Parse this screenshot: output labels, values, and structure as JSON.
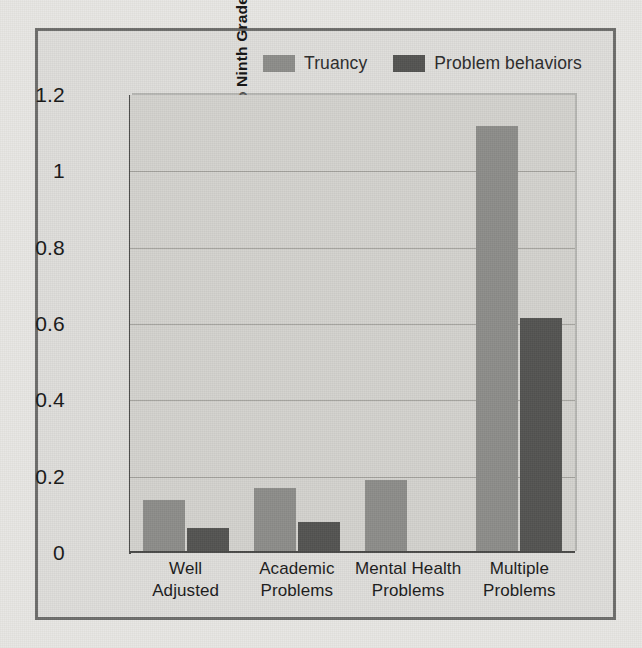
{
  "chart_data": {
    "type": "bar",
    "title": "",
    "xlabel": "",
    "ylabel": "Mean Increase from Eighth to Ninth Grade",
    "ylim": [
      0,
      1.2
    ],
    "yticks": [
      "0",
      "0.2",
      "0.4",
      "0.6",
      "0.8",
      "1",
      "1.2"
    ],
    "ytick_values": [
      0,
      0.2,
      0.4,
      0.6,
      0.8,
      1,
      1.2
    ],
    "grid": true,
    "legend_position": "top",
    "categories": [
      "Well\nAdjusted",
      "Academic\nProblems",
      "Mental Health\nProblems",
      "Multiple\nProblems"
    ],
    "category_lines": [
      [
        "Well",
        "Adjusted"
      ],
      [
        "Academic",
        "Problems"
      ],
      [
        "Mental Health",
        "Problems"
      ],
      [
        "Multiple",
        "Problems"
      ]
    ],
    "series": [
      {
        "name": "Truancy",
        "color": "#8d8d8a",
        "values": [
          0.14,
          0.17,
          0.19,
          1.12
        ]
      },
      {
        "name": "Problem behaviors",
        "color": "#545452",
        "values": [
          0.065,
          0.08,
          null,
          0.615
        ]
      }
    ]
  },
  "legend": {
    "entries": [
      {
        "label": "Truancy",
        "color": "#8d8d8a"
      },
      {
        "label": "Problem behaviors",
        "color": "#545452"
      }
    ]
  },
  "colors": {
    "page_background": "#e8e7e3",
    "figure_background": "#dedddA",
    "plot_background": "#d3d2ce",
    "frame_border": "#6d6d6b",
    "axis": "#4a4a48",
    "gridline": "#a3a29d",
    "truancy": "#8d8d8a",
    "problem_behaviors": "#545452"
  }
}
